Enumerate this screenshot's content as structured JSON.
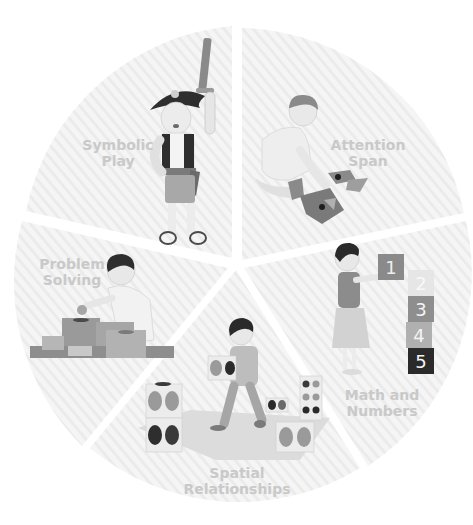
{
  "diagram": {
    "type": "pie-wheel-infographic",
    "center": [
      236,
      262
    ],
    "radius": 232,
    "colors": {
      "background": "#ffffff",
      "wedge_fill": "#f4f4f4",
      "wedge_stripe": "#ebebeb",
      "label_text": "#c9c9c9",
      "figure_dark": "#3a3a3a",
      "figure_mid": "#8a8a8a",
      "figure_light": "#d8d8d8"
    },
    "segments": [
      {
        "id": "symbolic-play",
        "line1": "Symbolic",
        "line2": "Play",
        "illustration": "child in pirate costume raising a toy sword"
      },
      {
        "id": "attention-span",
        "line1": "Attention",
        "line2": "Span",
        "illustration": "child kneeling and assembling puzzle pieces"
      },
      {
        "id": "math-and-numbers",
        "line1": "Math and",
        "line2": "Numbers",
        "illustration": "girl stacking numbered blocks",
        "blocks": [
          "1",
          "2",
          "3",
          "4",
          "5"
        ]
      },
      {
        "id": "spatial-relationships",
        "line1": "Spatial",
        "line2": "Relationships",
        "illustration": "child carrying a dotted cube among other cubes on a mat"
      },
      {
        "id": "problem-solving",
        "line1": "Problem",
        "line2": "Solving",
        "illustration": "child dropping a ball into a shape-sorter box"
      }
    ]
  }
}
